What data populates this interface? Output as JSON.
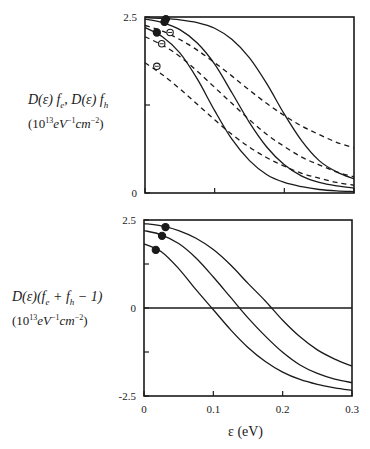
{
  "chart_data": [
    {
      "type": "line",
      "panel": "top",
      "ylabel_line1": "D(ε) f_e , D(ε) f_h",
      "ylabel_line2": "(10^13 eV^-1 cm^-2)",
      "ylim": [
        0,
        2.5
      ],
      "xlim": [
        0,
        0.3
      ],
      "y_ticks": [
        0,
        1.25,
        2.5
      ],
      "y_tick_labels": [
        "0",
        "",
        "2.5"
      ],
      "x_ticks": [
        0,
        0.1,
        0.2,
        0.3
      ],
      "x_tick_labels": [
        "",
        "",
        "",
        ""
      ],
      "x": [
        0,
        0.025,
        0.05,
        0.075,
        0.1,
        0.125,
        0.15,
        0.175,
        0.2,
        0.225,
        0.25,
        0.275,
        0.3
      ],
      "series": [
        {
          "name": "f_e solid 1",
          "style": "solid",
          "values": [
            2.49,
            2.48,
            2.46,
            2.42,
            2.34,
            2.18,
            1.92,
            1.55,
            1.12,
            0.74,
            0.46,
            0.3,
            0.2
          ]
        },
        {
          "name": "f_e solid 2",
          "style": "solid",
          "values": [
            2.47,
            2.42,
            2.32,
            2.13,
            1.83,
            1.42,
            1.0,
            0.65,
            0.4,
            0.24,
            0.15,
            0.1,
            0.07
          ]
        },
        {
          "name": "f_e solid 3",
          "style": "solid",
          "values": [
            2.35,
            2.22,
            1.99,
            1.62,
            1.17,
            0.76,
            0.46,
            0.26,
            0.15,
            0.09,
            0.05,
            0.03,
            0.02
          ]
        },
        {
          "name": "f_h dashed 1",
          "style": "dashed",
          "values": [
            2.38,
            2.3,
            2.18,
            2.03,
            1.85,
            1.66,
            1.46,
            1.27,
            1.1,
            0.95,
            0.83,
            0.72,
            0.64
          ]
        },
        {
          "name": "f_h dashed 2",
          "style": "dashed",
          "values": [
            2.22,
            2.1,
            1.94,
            1.73,
            1.5,
            1.27,
            1.04,
            0.83,
            0.66,
            0.51,
            0.4,
            0.3,
            0.23
          ]
        },
        {
          "name": "f_h dashed 3",
          "style": "dashed",
          "values": [
            1.85,
            1.68,
            1.48,
            1.26,
            1.04,
            0.83,
            0.65,
            0.5,
            0.38,
            0.28,
            0.21,
            0.15,
            0.11
          ]
        }
      ],
      "markers": [
        {
          "kind": "filled",
          "x": 0.03,
          "y": 2.47
        },
        {
          "kind": "filled",
          "x": 0.028,
          "y": 2.43
        },
        {
          "kind": "filled",
          "x": 0.017,
          "y": 2.28
        },
        {
          "kind": "open",
          "x": 0.036,
          "y": 2.28
        },
        {
          "kind": "open",
          "x": 0.024,
          "y": 2.12
        },
        {
          "kind": "open",
          "x": 0.017,
          "y": 1.8
        }
      ]
    },
    {
      "type": "line",
      "panel": "bottom",
      "ylabel_line1": "D(ε)(f_e + f_h − 1)",
      "ylabel_line2": "(10^13 eV^-1 cm^-2)",
      "xlabel": "ε (eV)",
      "ylim": [
        -2.5,
        2.5
      ],
      "xlim": [
        0,
        0.3
      ],
      "y_ticks": [
        -2.5,
        -1.25,
        0,
        1.25,
        2.5
      ],
      "y_tick_labels": [
        "-2.5",
        "",
        "0",
        "",
        "2.5"
      ],
      "x_ticks": [
        0,
        0.1,
        0.2,
        0.3
      ],
      "x_tick_labels": [
        "0",
        "0.1",
        "0.2",
        "0.3"
      ],
      "zero_line": true,
      "x": [
        0,
        0.025,
        0.05,
        0.075,
        0.1,
        0.125,
        0.15,
        0.175,
        0.2,
        0.225,
        0.25,
        0.275,
        0.3
      ],
      "series": [
        {
          "name": "curve 1",
          "style": "solid",
          "values": [
            2.4,
            2.33,
            2.2,
            1.98,
            1.66,
            1.22,
            0.7,
            0.2,
            -0.35,
            -0.82,
            -1.19,
            -1.45,
            -1.65
          ]
        },
        {
          "name": "curve 2",
          "style": "solid",
          "values": [
            2.2,
            2.08,
            1.83,
            1.42,
            0.88,
            0.3,
            -0.28,
            -0.8,
            -1.26,
            -1.62,
            -1.86,
            -2.02,
            -2.12
          ]
        },
        {
          "name": "curve 3",
          "style": "solid",
          "values": [
            1.82,
            1.6,
            1.12,
            0.52,
            -0.05,
            -0.62,
            -1.12,
            -1.52,
            -1.82,
            -2.03,
            -2.17,
            -2.27,
            -2.34
          ]
        }
      ],
      "markers": [
        {
          "kind": "filled",
          "x": 0.031,
          "y": 2.3
        },
        {
          "kind": "filled",
          "x": 0.026,
          "y": 2.05
        },
        {
          "kind": "filled",
          "x": 0.017,
          "y": 1.65
        }
      ]
    }
  ],
  "labels": {
    "top_y_line1": "D(ε) f",
    "top_y_sub_e": "e",
    "top_y_mid": ", D(ε) f",
    "top_y_sub_h": "h",
    "top_y_line2_a": "(10",
    "top_y_line2_exp": "13",
    "top_y_line2_b": "eV",
    "top_y_line2_exp2": "−1",
    "top_y_line2_c": "cm",
    "top_y_line2_exp3": "−2",
    "top_y_line2_d": ")",
    "bot_y_line1_a": "D(ε)(f",
    "bot_y_sub_e": "e",
    "bot_y_line1_b": " + f",
    "bot_y_sub_h": "h",
    "bot_y_line1_c": " − 1)",
    "x_axis": "ε (eV)"
  }
}
